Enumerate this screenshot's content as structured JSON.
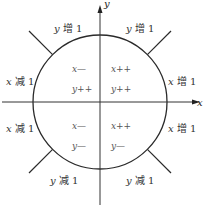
{
  "diagram": {
    "type": "circle-octant-direction-diagram",
    "axes": {
      "x_label": "x",
      "y_label": "y"
    },
    "outer_labels": {
      "top_left": {
        "var": "y",
        "text": " 增 1"
      },
      "top_right": {
        "var": "y",
        "text": " 增 1"
      },
      "left_upper": {
        "var": "x",
        "text": " 减 1"
      },
      "right_upper": {
        "var": "x",
        "text": " 增 1"
      },
      "left_lower": {
        "var": "x",
        "text": " 减 1"
      },
      "right_lower": {
        "var": "x",
        "text": " 增 1"
      },
      "bottom_left": {
        "var": "y",
        "text": " 减 1"
      },
      "bottom_right": {
        "var": "y",
        "text": " 减 1"
      }
    },
    "quadrant_ops": {
      "q2": {
        "line1": "x—",
        "line2": "y++"
      },
      "q1": {
        "line1": "x++",
        "line2": "y++"
      },
      "q3": {
        "line1": "x—",
        "line2": "y—"
      },
      "q4": {
        "line1": "x++",
        "line2": "y—"
      }
    },
    "colors": {
      "stroke": "#2a2a2a",
      "text": "#333333"
    }
  }
}
